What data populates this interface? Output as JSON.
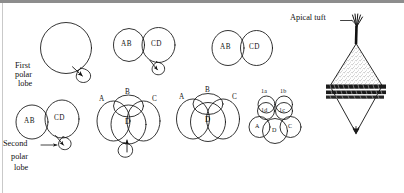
{
  "figure": {
    "title_text": "",
    "domain_kind": "biological-diagram",
    "colors": {
      "ink": "#111111",
      "background": "#ffffff",
      "top_band": "#8d8d8d",
      "left_rule": "#c9c9c9",
      "stipple": "#5a5a5a"
    }
  },
  "callouts": {
    "first_polar_lobe": "First\npolar\nlobe",
    "first_polar_lobe_line1": "First",
    "first_polar_lobe_line2": "polar",
    "first_polar_lobe_line3": "lobe",
    "second_polar_lobe_line1": "Second",
    "second_polar_lobe_line2": "polar",
    "second_polar_lobe_line3": "lobe",
    "apical_tuft": "Apical tuft"
  },
  "stages": [
    {
      "id": "stage-1-zygote",
      "name": "zygote-with-first-polar-lobe",
      "cell_labels": [],
      "has_polar_lobe": true,
      "polar_lobe_label": "first"
    },
    {
      "id": "stage-2-two-cell",
      "name": "two-cell-with-polar-lobe",
      "cell_labels": [
        "AB",
        "CD"
      ],
      "has_polar_lobe": true,
      "polar_lobe_label": "first"
    },
    {
      "id": "stage-3-four-cell-lobed",
      "name": "four-cell-with-second-polar-lobe",
      "cell_labels": [
        "A",
        "B",
        "C",
        "D"
      ],
      "has_polar_lobe": true,
      "polar_lobe_label": "second"
    },
    {
      "id": "stage-4-two-cell-resorbed",
      "name": "two-cell-lobe-resorbed",
      "cell_labels": [
        "AB",
        "CD"
      ],
      "has_polar_lobe": false
    },
    {
      "id": "stage-5-four-cell",
      "name": "four-cell-lobe-resorbed",
      "cell_labels": [
        "A",
        "B",
        "C",
        "D"
      ],
      "has_polar_lobe": false
    },
    {
      "id": "stage-6-eight-cell",
      "name": "eight-cell-micromeres",
      "cell_labels": [
        "1a",
        "1b",
        "1c",
        "1d",
        "A",
        "C",
        "D"
      ],
      "has_polar_lobe": false
    },
    {
      "id": "stage-7-trochophore",
      "name": "trochophore-larva",
      "cell_labels": [],
      "has_polar_lobe": false
    }
  ],
  "labels": {
    "AB": "AB",
    "CD": "CD",
    "A": "A",
    "B": "B",
    "C": "C",
    "D": "D",
    "one_a": "1a",
    "one_b": "1b",
    "one_c": "1c",
    "one_d": "1d"
  }
}
